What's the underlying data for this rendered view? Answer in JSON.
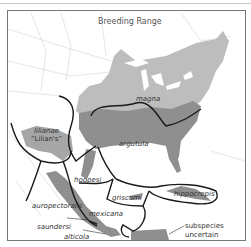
{
  "map": {
    "title": "Breeding Range",
    "colors": {
      "range_light": "#bdbdbd",
      "range_dark": "#8f8f8f",
      "boundary": "#1a1a1a",
      "borders": "#d0d0d0",
      "frame": "#777777"
    },
    "subspecies": [
      {
        "name": "magna"
      },
      {
        "name": "argutula"
      },
      {
        "name": "lilianae",
        "alt": "“Lilian's”"
      },
      {
        "name": "hoopesi"
      },
      {
        "name": "griscomi"
      },
      {
        "name": "hippocrepis"
      },
      {
        "name": "auropectoralis"
      },
      {
        "name": "mexicana"
      },
      {
        "name": "saundersi"
      },
      {
        "name": "alticola"
      }
    ],
    "annotation": {
      "line1": "subspecies",
      "line2": "uncertain"
    }
  }
}
